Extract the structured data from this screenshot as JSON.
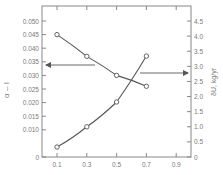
{
  "chart_data": {
    "type": "line",
    "title": "",
    "xlabel": "",
    "x": [
      0.1,
      0.3,
      0.5,
      0.7
    ],
    "x_ticks": [
      "0.1",
      "0.3",
      "0.5",
      "0.7",
      "0.9"
    ],
    "xlim": [
      0.0,
      1.0
    ],
    "left_axis": {
      "label": "α – I",
      "ticks": [
        "0",
        "0.010",
        "0.015",
        "0.020",
        "0.025",
        "0.030",
        "0.035",
        "0.040",
        "0.045",
        "0.050"
      ],
      "ylim": [
        0,
        0.05
      ]
    },
    "right_axis": {
      "label": "δU, kg/yr",
      "ticks": [
        "0",
        "0.5",
        "1.0",
        "1.5",
        "2.0",
        "2.5",
        "3.0",
        "3.5",
        "4.0",
        "4.5"
      ],
      "ylim": [
        0,
        4.5
      ]
    },
    "series": [
      {
        "name": "α – I",
        "axis": "left",
        "marker": "circle",
        "values": [
          0.045,
          0.037,
          0.03,
          0.026
        ]
      },
      {
        "name": "δU, kg/yr",
        "axis": "right",
        "marker": "circle",
        "values": [
          0.33,
          1.0,
          1.82,
          3.34
        ]
      }
    ],
    "annotations": [
      {
        "type": "arrow",
        "direction": "left",
        "points_to": "left axis",
        "at_y_left": 0.035
      },
      {
        "type": "arrow",
        "direction": "right",
        "points_to": "right axis",
        "at_y_right": 2.8
      }
    ],
    "grid": false,
    "legend": "none"
  }
}
